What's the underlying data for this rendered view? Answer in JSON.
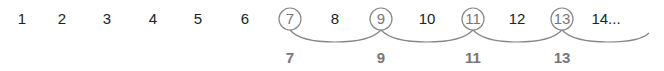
{
  "diagram": {
    "sequence": [
      {
        "label": "1",
        "x": 22,
        "circled": false
      },
      {
        "label": "2",
        "x": 62,
        "circled": false
      },
      {
        "label": "3",
        "x": 107,
        "circled": false
      },
      {
        "label": "4",
        "x": 153,
        "circled": false
      },
      {
        "label": "5",
        "x": 198,
        "circled": false
      },
      {
        "label": "6",
        "x": 245,
        "circled": false
      },
      {
        "label": "7",
        "x": 290,
        "circled": true
      },
      {
        "label": "8",
        "x": 335,
        "circled": false
      },
      {
        "label": "9",
        "x": 381,
        "circled": true
      },
      {
        "label": "10",
        "x": 427,
        "circled": false
      },
      {
        "label": "11",
        "x": 473,
        "circled": true
      },
      {
        "label": "12",
        "x": 517,
        "circled": false
      },
      {
        "label": "13",
        "x": 562,
        "circled": true
      },
      {
        "label": "14...",
        "x": 606,
        "circled": false
      }
    ],
    "selected": [
      {
        "label": "7",
        "x": 290
      },
      {
        "label": "9",
        "x": 381
      },
      {
        "label": "11",
        "x": 473
      },
      {
        "label": "13",
        "x": 562
      }
    ],
    "colors": {
      "text": "#222222",
      "highlight": "#777777",
      "arc": "#888888"
    }
  }
}
